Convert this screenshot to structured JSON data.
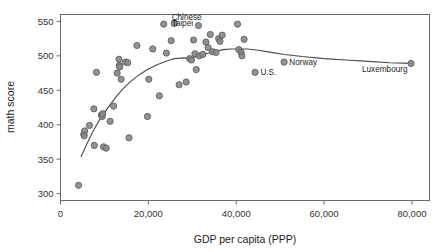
{
  "chart_data": {
    "type": "scatter",
    "title": "",
    "xlabel": "GDP per capita (PPP)",
    "ylabel": "math score",
    "xlim": [
      0,
      84000
    ],
    "ylim": [
      290,
      560
    ],
    "grid": false,
    "legend": null,
    "xticks": [
      0,
      20000,
      40000,
      60000,
      80000
    ],
    "xticklabels": [
      "0",
      "20,000",
      "40,000",
      "60,000",
      "80,000"
    ],
    "yticks": [
      300,
      350,
      400,
      450,
      500,
      550
    ],
    "yticklabels": [
      "300",
      "350",
      "400",
      "450",
      "500",
      "550"
    ],
    "marker_color": "#8a8a8a",
    "marker_edge_color": "#5e5e5e",
    "line_color": "#4a4a4a",
    "points": [
      {
        "x": 4100,
        "y": 312,
        "label": ""
      },
      {
        "x": 5300,
        "y": 386,
        "label": ""
      },
      {
        "x": 5500,
        "y": 391,
        "label": ""
      },
      {
        "x": 5400,
        "y": 384,
        "label": ""
      },
      {
        "x": 6600,
        "y": 399,
        "label": ""
      },
      {
        "x": 7600,
        "y": 423,
        "label": ""
      },
      {
        "x": 7700,
        "y": 370,
        "label": ""
      },
      {
        "x": 8200,
        "y": 476,
        "label": ""
      },
      {
        "x": 9300,
        "y": 414,
        "label": ""
      },
      {
        "x": 9500,
        "y": 412,
        "label": ""
      },
      {
        "x": 9600,
        "y": 416,
        "label": ""
      },
      {
        "x": 9800,
        "y": 368,
        "label": ""
      },
      {
        "x": 10400,
        "y": 366,
        "label": ""
      },
      {
        "x": 11300,
        "y": 405,
        "label": ""
      },
      {
        "x": 12100,
        "y": 427,
        "label": ""
      },
      {
        "x": 12900,
        "y": 475,
        "label": ""
      },
      {
        "x": 13300,
        "y": 495,
        "label": ""
      },
      {
        "x": 13400,
        "y": 486,
        "label": ""
      },
      {
        "x": 13500,
        "y": 484,
        "label": ""
      },
      {
        "x": 13800,
        "y": 466,
        "label": ""
      },
      {
        "x": 14800,
        "y": 491,
        "label": ""
      },
      {
        "x": 15300,
        "y": 490,
        "label": ""
      },
      {
        "x": 15600,
        "y": 381,
        "label": ""
      },
      {
        "x": 17400,
        "y": 515,
        "label": ""
      },
      {
        "x": 19800,
        "y": 412,
        "label": ""
      },
      {
        "x": 20100,
        "y": 466,
        "label": ""
      },
      {
        "x": 21000,
        "y": 510,
        "label": ""
      },
      {
        "x": 22500,
        "y": 442,
        "label": ""
      },
      {
        "x": 23500,
        "y": 546,
        "label": ""
      },
      {
        "x": 24100,
        "y": 504,
        "label": ""
      },
      {
        "x": 25200,
        "y": 522,
        "label": ""
      },
      {
        "x": 25900,
        "y": 547,
        "label": "Chinese Taipei"
      },
      {
        "x": 27000,
        "y": 458,
        "label": ""
      },
      {
        "x": 28600,
        "y": 462,
        "label": ""
      },
      {
        "x": 29400,
        "y": 496,
        "label": ""
      },
      {
        "x": 29800,
        "y": 494,
        "label": ""
      },
      {
        "x": 30300,
        "y": 523,
        "label": ""
      },
      {
        "x": 30600,
        "y": 503,
        "label": ""
      },
      {
        "x": 30900,
        "y": 480,
        "label": ""
      },
      {
        "x": 31400,
        "y": 544,
        "label": ""
      },
      {
        "x": 31600,
        "y": 500,
        "label": ""
      },
      {
        "x": 32400,
        "y": 502,
        "label": ""
      },
      {
        "x": 33100,
        "y": 520,
        "label": ""
      },
      {
        "x": 33600,
        "y": 512,
        "label": ""
      },
      {
        "x": 34100,
        "y": 531,
        "label": ""
      },
      {
        "x": 34600,
        "y": 506,
        "label": ""
      },
      {
        "x": 35400,
        "y": 505,
        "label": ""
      },
      {
        "x": 36000,
        "y": 525,
        "label": ""
      },
      {
        "x": 36300,
        "y": 521,
        "label": ""
      },
      {
        "x": 36800,
        "y": 530,
        "label": ""
      },
      {
        "x": 40300,
        "y": 546,
        "label": ""
      },
      {
        "x": 40600,
        "y": 509,
        "label": ""
      },
      {
        "x": 41100,
        "y": 505,
        "label": ""
      },
      {
        "x": 41300,
        "y": 500,
        "label": ""
      },
      {
        "x": 41800,
        "y": 524,
        "label": ""
      },
      {
        "x": 44300,
        "y": 476,
        "label": "U.S."
      },
      {
        "x": 50900,
        "y": 491,
        "label": "Norway"
      },
      {
        "x": 79800,
        "y": 489,
        "label": "Luxembourg"
      }
    ],
    "trendline": {
      "name": "lowess fit",
      "x": [
        4700,
        6000,
        7200,
        8500,
        9800,
        11200,
        12600,
        14200,
        16000,
        18000,
        20000,
        22000,
        24000,
        26000,
        28000,
        29500,
        31000,
        33000,
        35000,
        37000,
        39000,
        40500,
        42500,
        45000,
        48000,
        51000,
        55000,
        60000,
        65000,
        70000,
        75000,
        79800
      ],
      "y": [
        354,
        372,
        388,
        403,
        416,
        428,
        440,
        452,
        463,
        473,
        481,
        487,
        492,
        496,
        497,
        496,
        499,
        503,
        506,
        509,
        510,
        510,
        510,
        508,
        505,
        502,
        499,
        496,
        494,
        492,
        490,
        489
      ]
    },
    "annotations": [
      {
        "text": "Chinese",
        "x": 25300,
        "y": 556,
        "anchor": "start"
      },
      {
        "text": "Taipei",
        "x": 25300,
        "y": 547,
        "anchor": "start"
      },
      {
        "text": "U.S.",
        "x": 45500,
        "y": 476,
        "anchor": "start"
      },
      {
        "text": "Norway",
        "x": 52100,
        "y": 491,
        "anchor": "start"
      },
      {
        "text": "Luxembourg",
        "x": 79000,
        "y": 481,
        "anchor": "end"
      }
    ]
  }
}
